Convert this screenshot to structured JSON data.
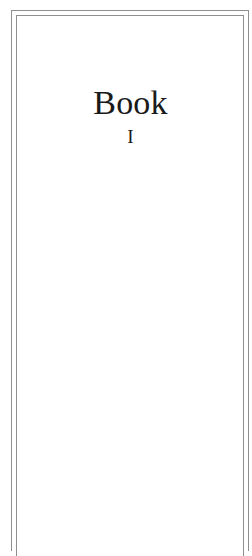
{
  "page": {
    "title": "Book",
    "numeral": "I"
  },
  "colors": {
    "frame": "#8f8f8f",
    "text": "#1a1a1a",
    "background": "#ffffff"
  }
}
